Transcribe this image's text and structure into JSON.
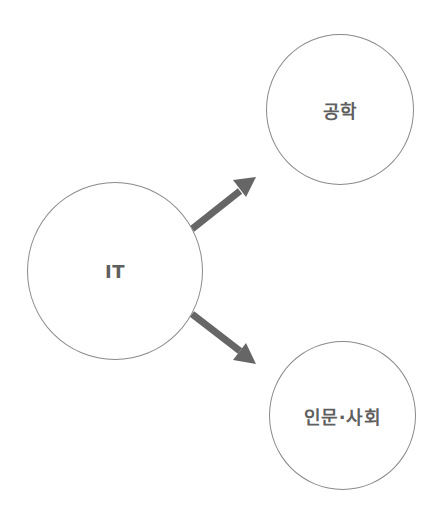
{
  "diagram": {
    "type": "concept-branch",
    "nodes": [
      {
        "id": "it",
        "label": "IT"
      },
      {
        "id": "engineering",
        "label": "공학"
      },
      {
        "id": "humanities",
        "label": "인문·사회"
      }
    ],
    "edges": [
      {
        "from": "it",
        "to": "engineering"
      },
      {
        "from": "it",
        "to": "humanities"
      }
    ],
    "colors": {
      "circle_border": "#8a8a8a",
      "arrow": "#666666",
      "label": "#5f5f5f",
      "background": "#ffffff"
    }
  }
}
